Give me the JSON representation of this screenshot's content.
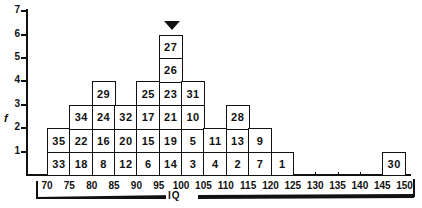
{
  "chart_data": {
    "type": "bar",
    "subtype": "stacked-box-histogram",
    "title": "",
    "xlabel": "IQ",
    "ylabel": "f",
    "ylim": [
      0,
      7
    ],
    "y_ticks": [
      "1",
      "2",
      "3",
      "4",
      "5",
      "6",
      "7"
    ],
    "x_tick_labels": [
      "70",
      "75",
      "80",
      "85",
      "90",
      "95",
      "100",
      "105",
      "110",
      "115",
      "120",
      "125",
      "130",
      "135",
      "140",
      "145",
      "150"
    ],
    "categories": [
      "70-75",
      "75-80",
      "80-85",
      "85-90",
      "90-95",
      "95-100",
      "100-105",
      "105-110",
      "110-115",
      "115-120",
      "120-125",
      "125-130",
      "130-135",
      "135-140",
      "140-145",
      "145-150"
    ],
    "values": [
      2,
      3,
      4,
      3,
      4,
      6,
      4,
      2,
      3,
      2,
      1,
      0,
      0,
      0,
      0,
      1
    ],
    "bins": [
      {
        "range": "70-75",
        "cases": [
          "33",
          "35"
        ]
      },
      {
        "range": "75-80",
        "cases": [
          "18",
          "22",
          "34"
        ]
      },
      {
        "range": "80-85",
        "cases": [
          "8",
          "16",
          "24",
          "29"
        ]
      },
      {
        "range": "85-90",
        "cases": [
          "12",
          "20",
          "32"
        ]
      },
      {
        "range": "90-95",
        "cases": [
          "6",
          "15",
          "17",
          "25"
        ]
      },
      {
        "range": "95-100",
        "cases": [
          "14",
          "19",
          "21",
          "23",
          "26",
          "27"
        ]
      },
      {
        "range": "100-105",
        "cases": [
          "3",
          "5",
          "10",
          "31"
        ]
      },
      {
        "range": "105-110",
        "cases": [
          "4",
          "11"
        ]
      },
      {
        "range": "110-115",
        "cases": [
          "2",
          "13",
          "28"
        ]
      },
      {
        "range": "115-120",
        "cases": [
          "7",
          "9"
        ]
      },
      {
        "range": "120-125",
        "cases": [
          "1"
        ]
      },
      {
        "range": "125-130",
        "cases": []
      },
      {
        "range": "130-135",
        "cases": []
      },
      {
        "range": "135-140",
        "cases": []
      },
      {
        "range": "140-145",
        "cases": []
      },
      {
        "range": "145-150",
        "cases": [
          "30"
        ]
      }
    ],
    "annotations": [
      {
        "type": "marker",
        "shape": "downward-triangle",
        "bin": "95-100",
        "meaning": "mode"
      }
    ],
    "grid": false,
    "legend": null
  },
  "colors": {
    "ink": "#111111",
    "background": "#ffffff"
  }
}
